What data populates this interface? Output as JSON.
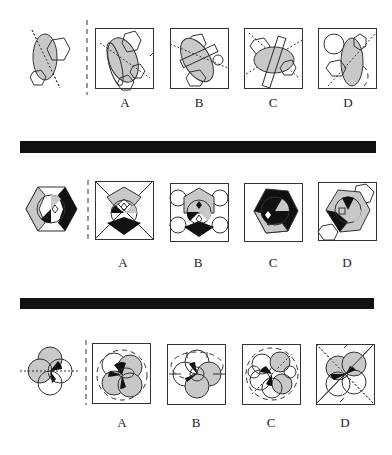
{
  "puzzle": {
    "rows": [
      {
        "id": "row-1",
        "question_figure": "grey-ellipse-with-hexagons-and-dotted-axis",
        "options": [
          {
            "label": "A"
          },
          {
            "label": "B"
          },
          {
            "label": "C"
          },
          {
            "label": "D"
          }
        ]
      },
      {
        "id": "row-2",
        "question_figure": "hexagon-with-circle-and-quadrant-fills",
        "options": [
          {
            "label": "A"
          },
          {
            "label": "B"
          },
          {
            "label": "C"
          },
          {
            "label": "D"
          }
        ]
      },
      {
        "id": "row-3",
        "question_figure": "four-overlapping-circles-with-dotted-axis",
        "options": [
          {
            "label": "A"
          },
          {
            "label": "B"
          },
          {
            "label": "C"
          },
          {
            "label": "D"
          }
        ]
      }
    ],
    "colors": {
      "grey_fill": "#c8c8c8",
      "black_fill": "#111111",
      "stroke": "#333333",
      "separator": "#111111"
    }
  }
}
